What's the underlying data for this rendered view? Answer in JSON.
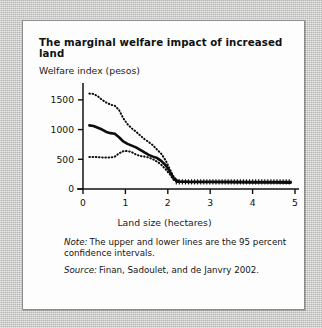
{
  "figure": {
    "title": "The marginal welfare impact of increased land",
    "note_label": "Note:",
    "note_text": "The upper and lower lines are the 95 percent confidence intervals.",
    "source_label": "Source:",
    "source_text": "Finan, Sadoulet, and de Janvry 2002."
  },
  "chart_data": {
    "type": "line",
    "title": "The marginal welfare impact of increased land",
    "xlabel": "Land size (hectares)",
    "ylabel": "Welfare index (pesos)",
    "xlim": [
      0,
      5
    ],
    "ylim": [
      0,
      1750
    ],
    "xticks": [
      0,
      1,
      2,
      3,
      4,
      5
    ],
    "yticks": [
      0,
      500,
      1000,
      1500
    ],
    "xtick_labels": [
      "0",
      "1",
      "2",
      "3",
      "4",
      "5"
    ],
    "ytick_labels": [
      "0",
      "500",
      "1000",
      "1500"
    ],
    "grid": false,
    "legend": "none",
    "series": [
      {
        "name": "Upper 95% confidence interval",
        "style": "dotted",
        "x": [
          0.15,
          0.25,
          0.35,
          0.45,
          0.55,
          0.65,
          0.75,
          0.85,
          0.95,
          1.05,
          1.15,
          1.25,
          1.35,
          1.45,
          1.55,
          1.65,
          1.75,
          1.85,
          1.95,
          2.05,
          2.15,
          2.25
        ],
        "y": [
          1605,
          1600,
          1560,
          1500,
          1455,
          1420,
          1400,
          1330,
          1190,
          1090,
          1020,
          965,
          900,
          840,
          790,
          735,
          660,
          590,
          480,
          330,
          190,
          140
        ]
      },
      {
        "name": "Estimate",
        "style": "solid",
        "x": [
          0.15,
          0.25,
          0.35,
          0.45,
          0.55,
          0.65,
          0.75,
          0.85,
          0.95,
          1.05,
          1.15,
          1.25,
          1.35,
          1.45,
          1.55,
          1.65,
          1.75,
          1.85,
          1.95,
          2.05,
          2.15,
          2.25,
          2.5,
          3.0,
          3.5,
          4.0,
          4.5,
          4.9
        ],
        "y": [
          1070,
          1060,
          1030,
          1000,
          960,
          940,
          930,
          870,
          800,
          760,
          730,
          700,
          660,
          615,
          575,
          545,
          520,
          470,
          400,
          290,
          165,
          125,
          120,
          118,
          115,
          112,
          110,
          108
        ]
      },
      {
        "name": "Lower 95% confidence interval",
        "style": "dotted",
        "x": [
          0.15,
          0.25,
          0.35,
          0.45,
          0.55,
          0.65,
          0.75,
          0.85,
          0.95,
          1.05,
          1.15,
          1.25,
          1.35,
          1.45,
          1.55,
          1.65,
          1.75,
          1.85,
          1.95,
          2.05,
          2.15,
          2.25
        ],
        "y": [
          540,
          540,
          535,
          532,
          530,
          528,
          545,
          600,
          635,
          640,
          620,
          580,
          555,
          545,
          530,
          500,
          460,
          405,
          330,
          245,
          140,
          110
        ]
      }
    ],
    "flat_tail_markers": {
      "description": "Dense plus/cross markers along the flat segment",
      "x_start": 2.2,
      "x_end": 4.92,
      "y": 120
    }
  }
}
